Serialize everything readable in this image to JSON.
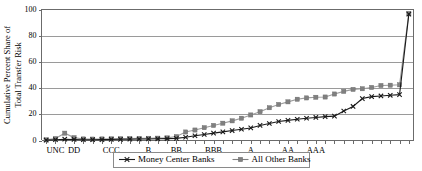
{
  "chart_data": {
    "type": "line",
    "title": "",
    "subtitle": "",
    "xlabel": "",
    "ylabel": "Cumulative Percent Share of Total Transfer Risk",
    "ylabel_line1": "Cumulative Percent Share of",
    "ylabel_line2": "Total Transfer Risk",
    "ylim": [
      0,
      100
    ],
    "ytick_labels": [
      "0",
      "20",
      "40",
      "60",
      "80",
      "100"
    ],
    "ytick_values": [
      0,
      20,
      40,
      60,
      80,
      100
    ],
    "grid": true,
    "grid_axis": "y",
    "legend_position": "bottom-center",
    "x_index_count": 40,
    "xtick_labels": [
      {
        "label": "UNC",
        "index": 1
      },
      {
        "label": "DD",
        "index": 3
      },
      {
        "label": "CCC",
        "index": 7
      },
      {
        "label": "B",
        "index": 11
      },
      {
        "label": "BB",
        "index": 14
      },
      {
        "label": "BBB",
        "index": 18
      },
      {
        "label": "A",
        "index": 22
      },
      {
        "label": "AA",
        "index": 26
      },
      {
        "label": "AAA",
        "index": 29
      }
    ],
    "series": [
      {
        "name": "Money Center Banks",
        "marker": "x",
        "color": "#1a1a1a",
        "values": [
          0.3,
          0.6,
          1.0,
          0.8,
          0.6,
          0.6,
          0.7,
          0.8,
          0.9,
          1.0,
          1.1,
          1.2,
          1.3,
          1.4,
          1.6,
          2.5,
          3.6,
          4.6,
          5.6,
          6.6,
          7.6,
          8.6,
          9.6,
          11.5,
          13.0,
          14.5,
          15.4,
          16.2,
          17.0,
          17.6,
          18.2,
          18.6,
          22.5,
          26.0,
          32.0,
          33.5,
          34.0,
          34.5,
          35.0,
          96.5
        ]
      },
      {
        "name": "All Other Banks",
        "marker": "square",
        "color": "#808080",
        "values": [
          0.5,
          1.5,
          5.6,
          2.2,
          1.2,
          1.1,
          1.2,
          1.3,
          1.4,
          1.5,
          1.6,
          1.7,
          1.8,
          2.0,
          3.0,
          6.5,
          8.0,
          9.8,
          11.5,
          13.2,
          15.0,
          17.0,
          19.5,
          22.0,
          25.0,
          27.5,
          29.5,
          31.5,
          32.5,
          33.0,
          33.2,
          35.5,
          37.5,
          39.0,
          39.5,
          40.5,
          42.0,
          42.2,
          42.5,
          97.0
        ]
      }
    ]
  },
  "legend": {
    "items": [
      {
        "label": "Money Center Banks",
        "marker": "x-marker",
        "color": "#1a1a1a"
      },
      {
        "label": "All Other Banks",
        "marker": "square-marker",
        "color": "#808080"
      }
    ]
  }
}
